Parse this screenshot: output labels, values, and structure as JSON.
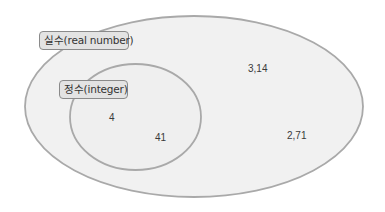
{
  "diagram": {
    "type": "venn",
    "sets": [
      {
        "id": "real",
        "label": "실수(real number)",
        "contains": [
          "integer"
        ],
        "elements": [
          "3,14",
          "2,71"
        ]
      },
      {
        "id": "integer",
        "label": "정수(integer)",
        "elements": [
          "4",
          "41"
        ]
      }
    ],
    "colors": {
      "background": "#ffffff",
      "set_fill": "#f1f1f1",
      "set_stroke": "#a9a9a9",
      "label_fill": "#e3e3e3",
      "label_border": "#8a8a8a",
      "text": "#333333"
    }
  },
  "labels": {
    "real": "실수(real number)",
    "integer": "정수(integer)"
  },
  "elements": {
    "real_only": [
      "3,14",
      "2,71"
    ],
    "integer": [
      "4",
      "41"
    ]
  }
}
